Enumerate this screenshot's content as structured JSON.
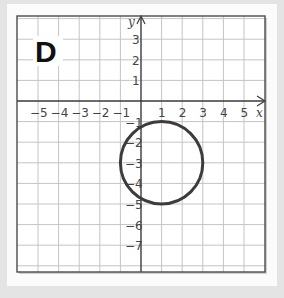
{
  "panel": {
    "label": "D"
  },
  "axes": {
    "x_label": "x",
    "y_label": "y",
    "x_tick_labels": [
      "−5",
      "−4",
      "−3",
      "−2",
      "−1",
      "1",
      "2",
      "3",
      "4",
      "5"
    ],
    "y_tick_labels": [
      "3",
      "2",
      "1",
      "−1",
      "−2",
      "−3",
      "−4",
      "−5",
      "−6",
      "−7"
    ]
  },
  "colors": {
    "grid": "#bdbdbd",
    "axis": "#3a3a3a",
    "circle": "#3c3c3c",
    "frame": "#4a4a4a",
    "background": "#e4e4e4",
    "panel": "#fbfbfb"
  },
  "chart_data": {
    "type": "scatter",
    "title": "D",
    "xlabel": "x",
    "ylabel": "y",
    "xlim": [
      -6,
      6
    ],
    "ylim": [
      -8,
      4
    ],
    "grid": true,
    "x_ticks": [
      -5,
      -4,
      -3,
      -2,
      -1,
      1,
      2,
      3,
      4,
      5
    ],
    "y_ticks": [
      3,
      2,
      1,
      -1,
      -2,
      -3,
      -4,
      -5,
      -6,
      -7
    ],
    "shapes": [
      {
        "shape": "circle",
        "center": [
          1,
          -3
        ],
        "radius": 2
      }
    ]
  }
}
